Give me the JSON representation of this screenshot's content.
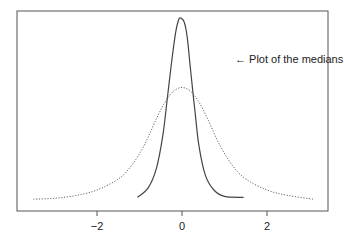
{
  "chart_data": {
    "type": "line",
    "title": "",
    "xlabel": "",
    "ylabel": "",
    "xlim": [
      -3.9,
      3.45
    ],
    "x_ticks": [
      -2,
      0,
      2
    ],
    "x_tick_labels": [
      "−2",
      "0",
      "2"
    ],
    "y_ticks": [],
    "grid": false,
    "annotations": [
      {
        "text": "← Plot of the medians",
        "x": 1.25,
        "y_frac": 0.83
      }
    ],
    "series": [
      {
        "name": "medians",
        "style": "solid",
        "x": [
          -1.05,
          -0.8,
          -0.6,
          -0.45,
          -0.35,
          -0.25,
          -0.15,
          -0.08,
          -0.03,
          0.05,
          0.12,
          0.2,
          0.3,
          0.4,
          0.55,
          0.75,
          1.0,
          1.45
        ],
        "y": [
          0.02,
          0.07,
          0.18,
          0.36,
          0.55,
          0.75,
          0.92,
          0.99,
          1.0,
          0.98,
          0.9,
          0.72,
          0.5,
          0.3,
          0.14,
          0.06,
          0.025,
          0.02
        ]
      },
      {
        "name": "reference density",
        "style": "dotted",
        "x": [
          -3.5,
          -3.0,
          -2.5,
          -2.0,
          -1.5,
          -1.2,
          -0.9,
          -0.6,
          -0.4,
          -0.2,
          0.0,
          0.2,
          0.4,
          0.6,
          0.9,
          1.2,
          1.5,
          2.0,
          2.5,
          3.1
        ],
        "y": [
          0.01,
          0.015,
          0.03,
          0.06,
          0.12,
          0.19,
          0.3,
          0.45,
          0.54,
          0.6,
          0.62,
          0.6,
          0.54,
          0.45,
          0.3,
          0.19,
          0.12,
          0.06,
          0.03,
          0.01
        ]
      }
    ]
  }
}
